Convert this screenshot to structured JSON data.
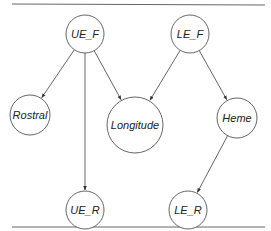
{
  "caption": "...",
  "colors": {
    "stroke": "#555555",
    "text": "#222222",
    "rule": "#666666"
  },
  "nodes": [
    {
      "id": "UE_F",
      "label": "UE_F",
      "cx": 85,
      "cy": 34,
      "r": 19
    },
    {
      "id": "LE_F",
      "label": "LE_F",
      "cx": 190,
      "cy": 34,
      "r": 19
    },
    {
      "id": "Rostral",
      "label": "Rostral",
      "cx": 30,
      "cy": 115,
      "r": 20
    },
    {
      "id": "Longitude",
      "label": "Longitude",
      "cx": 135,
      "cy": 125,
      "r": 28
    },
    {
      "id": "Heme",
      "label": "Heme",
      "cx": 237,
      "cy": 118,
      "r": 20
    },
    {
      "id": "UE_R",
      "label": "UE_R",
      "cx": 85,
      "cy": 210,
      "r": 19
    },
    {
      "id": "LE_R",
      "label": "LE_R",
      "cx": 188,
      "cy": 210,
      "r": 19
    }
  ],
  "edges": [
    {
      "from": "UE_F",
      "to": "Rostral"
    },
    {
      "from": "UE_F",
      "to": "UE_R"
    },
    {
      "from": "UE_F",
      "to": "Longitude"
    },
    {
      "from": "LE_F",
      "to": "Longitude"
    },
    {
      "from": "LE_F",
      "to": "Heme"
    },
    {
      "from": "Heme",
      "to": "LE_R"
    }
  ]
}
